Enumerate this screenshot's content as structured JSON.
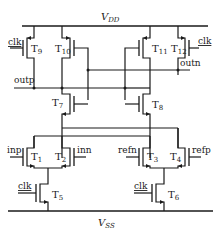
{
  "diagram": {
    "type": "CMOS dynamic latch comparator schematic",
    "rails": {
      "vdd": {
        "label": "V",
        "sub": "DD"
      },
      "vss": {
        "label": "V",
        "sub": "SS"
      }
    },
    "transistors": [
      {
        "id": "T1",
        "label": "T",
        "sub": "1",
        "type": "nmos",
        "gate": "inp"
      },
      {
        "id": "T2",
        "label": "T",
        "sub": "2",
        "type": "nmos",
        "gate": "inn"
      },
      {
        "id": "T3",
        "label": "T",
        "sub": "3",
        "type": "nmos",
        "gate": "refn"
      },
      {
        "id": "T4",
        "label": "T",
        "sub": "4",
        "type": "nmos",
        "gate": "refp"
      },
      {
        "id": "T5",
        "label": "T",
        "sub": "5",
        "type": "nmos",
        "gate": "clk"
      },
      {
        "id": "T6",
        "label": "T",
        "sub": "6",
        "type": "nmos",
        "gate": "clk"
      },
      {
        "id": "T7",
        "label": "T",
        "sub": "7",
        "type": "nmos",
        "gate": "outn"
      },
      {
        "id": "T8",
        "label": "T",
        "sub": "8",
        "type": "nmos",
        "gate": "outp"
      },
      {
        "id": "T9",
        "label": "T",
        "sub": "9",
        "type": "pmos",
        "gate": "clk"
      },
      {
        "id": "T10",
        "label": "T",
        "sub": "10",
        "type": "pmos",
        "gate": "outn"
      },
      {
        "id": "T11",
        "label": "T",
        "sub": "11",
        "type": "pmos",
        "gate": "outp"
      },
      {
        "id": "T12",
        "label": "T",
        "sub": "12",
        "type": "pmos",
        "gate": "clk"
      }
    ],
    "signals": {
      "clk_t9": "clk",
      "clk_t12": "clk",
      "clk_t5": "clk",
      "clk_t6": "clk",
      "outp": "outp",
      "outn": "outn",
      "inp": "inp",
      "inn": "inn",
      "refn": "refn",
      "refp": "refp"
    }
  }
}
